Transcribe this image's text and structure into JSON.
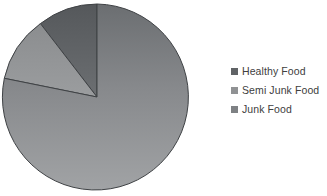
{
  "chart_data": {
    "type": "pie",
    "title": "",
    "categories": [
      "Healthy Food",
      "Semi Junk Food",
      "Junk Food"
    ],
    "values": [
      10.3,
      11.4,
      78.3
    ],
    "units": "percent",
    "start_angle_deg": 0,
    "direction": "counterclockwise",
    "slice_angles_deg": [
      37,
      41,
      282
    ],
    "colors": [
      "#606366",
      "#909294",
      "#8a8c8e"
    ],
    "legend_position": "right",
    "grid": false,
    "xlabel": "",
    "ylabel": ""
  },
  "legend": {
    "items": [
      {
        "label": "Healthy Food",
        "color": "#606366"
      },
      {
        "label": "Semi Junk Food",
        "color": "#909294"
      },
      {
        "label": "Junk Food",
        "color": "#7e8184"
      }
    ]
  },
  "pie": {
    "center_x": 97,
    "center_y": 97,
    "radius": 93,
    "slices": [
      {
        "name": "Healthy Food",
        "path": "M 97 97 L 97 4 A 93 93 0 0 0 40.4 23.6 Z",
        "fill": "url(#gradHealthy)"
      },
      {
        "name": "Semi Junk Food",
        "path": "M 97 97 L 40.4 23.6 A 93 93 0 0 0 4.3 78.3 Z",
        "fill": "url(#gradSemi)"
      },
      {
        "name": "Junk Food",
        "path": "M 97 97 L 4.3 78.3 A 93 93 0 1 0 97 4 Z",
        "fill": "url(#gradJunk)"
      }
    ]
  }
}
